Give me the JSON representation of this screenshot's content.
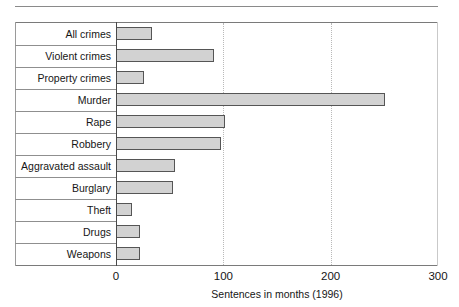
{
  "chart_data": {
    "type": "bar",
    "orientation": "horizontal",
    "title": "",
    "xlabel": "Sentences in months (1996)",
    "ylabel": "",
    "xlim": [
      0,
      300
    ],
    "xticks": [
      0,
      100,
      200,
      300
    ],
    "xtick_labels": [
      "0",
      "100",
      "200",
      "300"
    ],
    "grid": "vertical dotted gridlines at 100 and 200",
    "legend": "none",
    "categories": [
      "All crimes",
      "Violent crimes",
      "Property crimes",
      "Murder",
      "Rape",
      "Robbery",
      "Aggravated assault",
      "Burglary",
      "Theft",
      "Drugs",
      "Weapons"
    ],
    "values": [
      33,
      90,
      25,
      250,
      101,
      97,
      54,
      52,
      14,
      21,
      21
    ],
    "bar_fill_color": "#d2d2d2",
    "bar_border_color": "#555555"
  }
}
